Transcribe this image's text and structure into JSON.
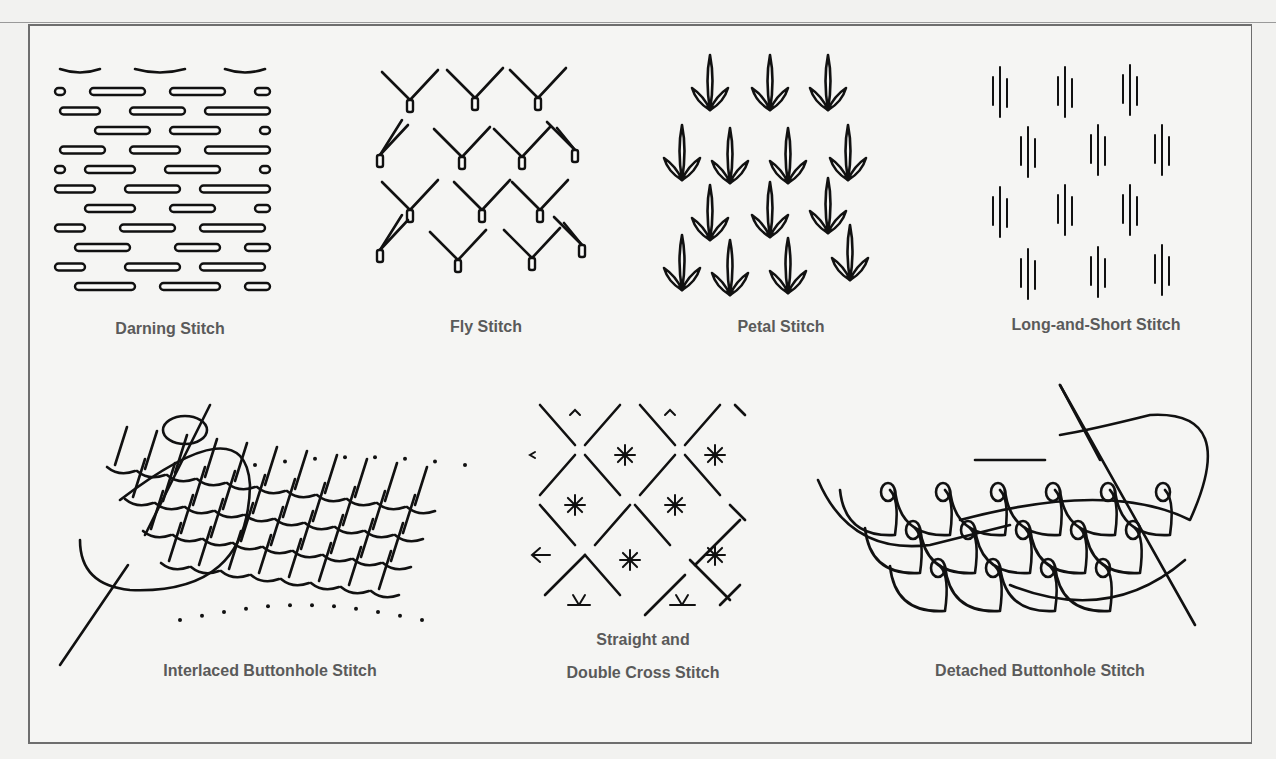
{
  "figure": {
    "panels": [
      {
        "id": "darning",
        "label": "Darning Stitch"
      },
      {
        "id": "fly",
        "label": "Fly Stitch"
      },
      {
        "id": "petal",
        "label": "Petal Stitch"
      },
      {
        "id": "long-short",
        "label": "Long-and-Short Stitch"
      },
      {
        "id": "interlaced-buttonhole",
        "label": "Interlaced Buttonhole Stitch"
      },
      {
        "id": "straight-double-cross",
        "label_line1": "Straight and",
        "label_line2": "Double Cross Stitch"
      },
      {
        "id": "detached-buttonhole",
        "label": "Detached Buttonhole Stitch"
      }
    ]
  },
  "colors": {
    "background": "#f2f2f0",
    "frame_border": "#6e6e6e",
    "ink": "#111111",
    "label_text": "#5a5a5a"
  }
}
